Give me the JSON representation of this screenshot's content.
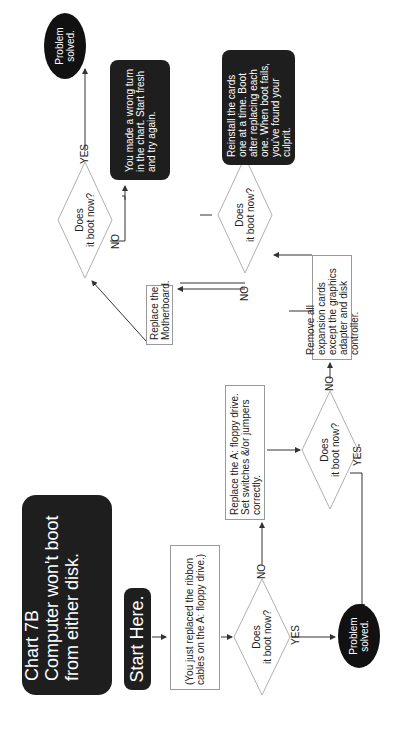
{
  "title": {
    "line1": "Chart 7B",
    "line2": "Computer won't boot",
    "line3": "from either disk."
  },
  "start": "Start Here.",
  "nodes": {
    "context": "(You just replaced the ribbon cables on the A: floppy drive.)",
    "decision1": {
      "line1": "Does",
      "line2": "it boot now?"
    },
    "solved1": {
      "line1": "Problem",
      "line2": "solved."
    },
    "replace_floppy": "Replace the A: floppy drive. Set switches &/or jumpers correctly.",
    "decision2": {
      "line1": "Does",
      "line2": "it boot now?"
    },
    "remove_cards": "Remove all expansion cards except the graphics adapter and disk controller.",
    "decision3": {
      "line1": "Does",
      "line2": "it boot now?"
    },
    "reinstall_cards": "Reinstall the cards one at a time. Boot after replacing each one. When boot fails, you've found your culprit.",
    "replace_motherboard": "Replace the Motherboard.",
    "decision4": {
      "line1": "Does",
      "line2": "it boot now?"
    },
    "wrong_turn": "You made a wrong turn in the chart. Start fresh and try again.",
    "solved2": {
      "line1": "Problem",
      "line2": "solved."
    }
  },
  "edge_labels": {
    "d1_yes": "YES",
    "d1_no": "NO",
    "d2_yes": "YES",
    "d2_no": "NO",
    "d3_yes": "YES",
    "d3_no": "NO",
    "d4_yes": "YES",
    "d4_no": "NO"
  },
  "colors": {
    "dark_fill": "#1e1e1e",
    "line": "#333333",
    "box_border": "#9a9a9a",
    "diamond_border": "#b0b0b0"
  }
}
